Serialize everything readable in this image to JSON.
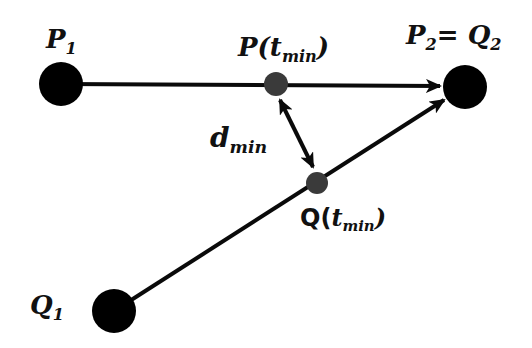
{
  "diagram": {
    "labels": {
      "p1": {
        "base": "P",
        "sub": "1"
      },
      "p2q2": {
        "base1": "P",
        "sub1": "2",
        "eq": "= ",
        "base2": "Q",
        "sub2": "2"
      },
      "pt": {
        "base": "P(",
        "t": "t",
        "sub": "min",
        "close": ")"
      },
      "dmin": {
        "base": "d",
        "sub": "min"
      },
      "qt": {
        "base": "Q",
        "open": "(",
        "t": "t",
        "sub": "min",
        "close": ")"
      },
      "q1": {
        "base": "Q",
        "sub": "1"
      }
    },
    "colors": {
      "point": "#000000",
      "intermediate_point": "#3a3a3a",
      "line": "#0a0a0a"
    }
  }
}
